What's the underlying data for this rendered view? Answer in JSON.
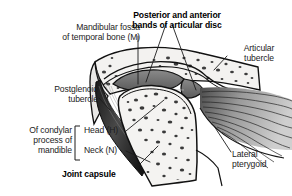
{
  "figure": {
    "background_color": "#ffffff",
    "line_color": "#111111",
    "bone_fill": "#f2f1ef",
    "disc_fill": "#6e6e6e",
    "capsule_fill": "#2b2b2b",
    "muscle_fill": "#8d8d8d"
  },
  "labels": {
    "mandibular_fossa": {
      "line1": "Mandibular fossa",
      "line2": "of temporal bone (M)",
      "bold": false,
      "align": "right"
    },
    "articular_disc_bands": {
      "line1": "Posterior and anterior",
      "line2": "bands of articular disc",
      "bold": true,
      "align": "center"
    },
    "articular_tubercle": {
      "line1": "Articular",
      "line2": "tubercle",
      "bold": false,
      "align": "center"
    },
    "postglenoid_tubercle": {
      "line1": "Postglenoid",
      "line2": "tubercle",
      "bold": false,
      "align": "right"
    },
    "condylar_process": {
      "line1": "Of condylar",
      "line2": "process of",
      "line3": "mandible",
      "bold": false,
      "align": "right"
    },
    "head": {
      "text": "Head (H)",
      "bold": false,
      "align": "left"
    },
    "neck": {
      "text": "Neck (N)",
      "bold": false,
      "align": "left"
    },
    "joint_capsule": {
      "text": "Joint capsule",
      "bold": true,
      "align": "left"
    },
    "lateral_pterygoid": {
      "line1": "Lateral",
      "line2": "pterygoid",
      "bold": false,
      "align": "left"
    }
  }
}
